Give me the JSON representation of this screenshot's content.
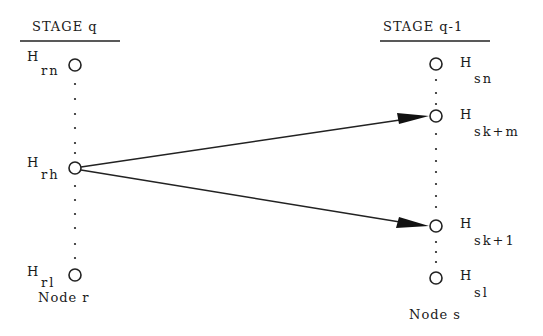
{
  "diagram": {
    "stages": [
      {
        "title": "STAGE q",
        "node_label": "Node r"
      },
      {
        "title": "STAGE q-1",
        "node_label": "Node s"
      }
    ],
    "left_nodes": [
      {
        "H": "H",
        "sub": "rn"
      },
      {
        "H": "H",
        "sub": "rh"
      },
      {
        "H": "H",
        "sub": "rl"
      }
    ],
    "right_nodes": [
      {
        "H": "H",
        "sub": "sn"
      },
      {
        "H": "H",
        "sub": "sk+m"
      },
      {
        "H": "H",
        "sub": "sk+1"
      },
      {
        "H": "H",
        "sub": "sl"
      }
    ],
    "edges": [
      {
        "from": "H rh",
        "to": "H sk+m"
      },
      {
        "from": "H rh",
        "to": "H sk+1"
      }
    ]
  }
}
